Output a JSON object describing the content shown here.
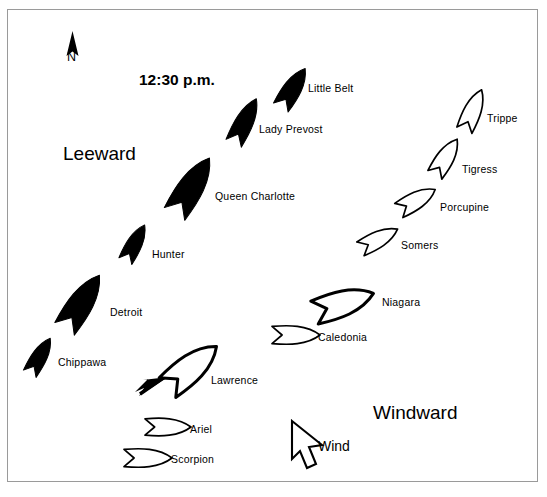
{
  "figure": {
    "title": "12:30 p.m.",
    "orientation_marker": "N",
    "wind_label": "Wind",
    "leeward_label": "Leeward",
    "windward_label": "Windward",
    "colors": {
      "british_fill": "#000000",
      "american_fill": "#ffffff",
      "stroke": "#000000",
      "border": "#9a9a9a",
      "background": "#ffffff"
    }
  },
  "chart_data": {
    "type": "diagram",
    "title": "12:30 p.m.",
    "annotations": [
      "N",
      "Leeward",
      "Windward",
      "Wind"
    ],
    "legend_convention": {
      "filled_black": "British squadron",
      "outline_white": "American squadron"
    },
    "ships": [
      {
        "name": "Little Belt",
        "side": "british",
        "x": 293,
        "y": 88,
        "length": 46,
        "width": 20,
        "angle": -58,
        "filled": true,
        "label_x": 308,
        "label_y": 89
      },
      {
        "name": "Lady Prevost",
        "side": "british",
        "x": 245,
        "y": 121,
        "length": 50,
        "width": 20,
        "angle": -63,
        "filled": true,
        "label_x": 259,
        "label_y": 130
      },
      {
        "name": "Queen Charlotte",
        "side": "british",
        "x": 192,
        "y": 186,
        "length": 66,
        "width": 28,
        "angle": -58,
        "filled": true,
        "label_x": 215,
        "label_y": 197
      },
      {
        "name": "Hunter",
        "side": "british",
        "x": 135,
        "y": 243,
        "length": 41,
        "width": 17,
        "angle": -62,
        "filled": true,
        "label_x": 152,
        "label_y": 255
      },
      {
        "name": "Detroit",
        "side": "british",
        "x": 82,
        "y": 302,
        "length": 64,
        "width": 27,
        "angle": -57,
        "filled": true,
        "label_x": 110,
        "label_y": 313
      },
      {
        "name": "Chippawa",
        "side": "british",
        "x": 40,
        "y": 356,
        "length": 41,
        "width": 17,
        "angle": -60,
        "filled": true,
        "label_x": 58,
        "label_y": 363
      },
      {
        "name": "Trippe",
        "side": "american",
        "x": 473,
        "y": 110,
        "length": 44,
        "width": 19,
        "angle": -67,
        "filled": false,
        "label_x": 487,
        "label_y": 119
      },
      {
        "name": "Tigress",
        "side": "american",
        "x": 446,
        "y": 157,
        "length": 42,
        "width": 19,
        "angle": -58,
        "filled": false,
        "label_x": 462,
        "label_y": 170
      },
      {
        "name": "Porcupine",
        "side": "american",
        "x": 417,
        "y": 200,
        "length": 42,
        "width": 19,
        "angle": -30,
        "filled": false,
        "label_x": 440,
        "label_y": 208
      },
      {
        "name": "Somers",
        "side": "american",
        "x": 379,
        "y": 239,
        "length": 42,
        "width": 18,
        "angle": -28,
        "filled": false,
        "label_x": 401,
        "label_y": 246
      },
      {
        "name": "Niagara",
        "side": "american",
        "x": 344,
        "y": 303,
        "length": 62,
        "width": 28,
        "angle": -18,
        "filled": false,
        "label_x": 382,
        "label_y": 303,
        "thick": true
      },
      {
        "name": "Caledonia",
        "side": "american",
        "x": 296,
        "y": 335,
        "length": 48,
        "width": 20,
        "angle": 0,
        "filled": false,
        "label_x": 318,
        "label_y": 338
      },
      {
        "name": "Lawrence",
        "side": "american",
        "x": 192,
        "y": 367,
        "length": 64,
        "width": 30,
        "angle": -40,
        "filled": false,
        "label_x": 211,
        "label_y": 381,
        "thick": true
      },
      {
        "name": "Ariel",
        "side": "american",
        "x": 168,
        "y": 427,
        "length": 46,
        "width": 19,
        "angle": 0,
        "filled": false,
        "label_x": 190,
        "label_y": 430
      },
      {
        "name": "Scorpion",
        "side": "american",
        "x": 148,
        "y": 458,
        "length": 48,
        "width": 20,
        "angle": 0,
        "filled": false,
        "label_x": 171,
        "label_y": 460
      }
    ],
    "labels": [
      {
        "text": "12:30 p.m.",
        "x": 139,
        "y": 83,
        "size": "title"
      },
      {
        "text": "Leeward",
        "x": 63,
        "y": 155,
        "size": "big"
      },
      {
        "text": "Windward",
        "x": 373,
        "y": 414,
        "size": "big"
      },
      {
        "text": "N",
        "x": 67,
        "y": 62,
        "size": "n"
      },
      {
        "text": "Wind",
        "x": 318,
        "y": 450,
        "size": "wind"
      }
    ]
  }
}
